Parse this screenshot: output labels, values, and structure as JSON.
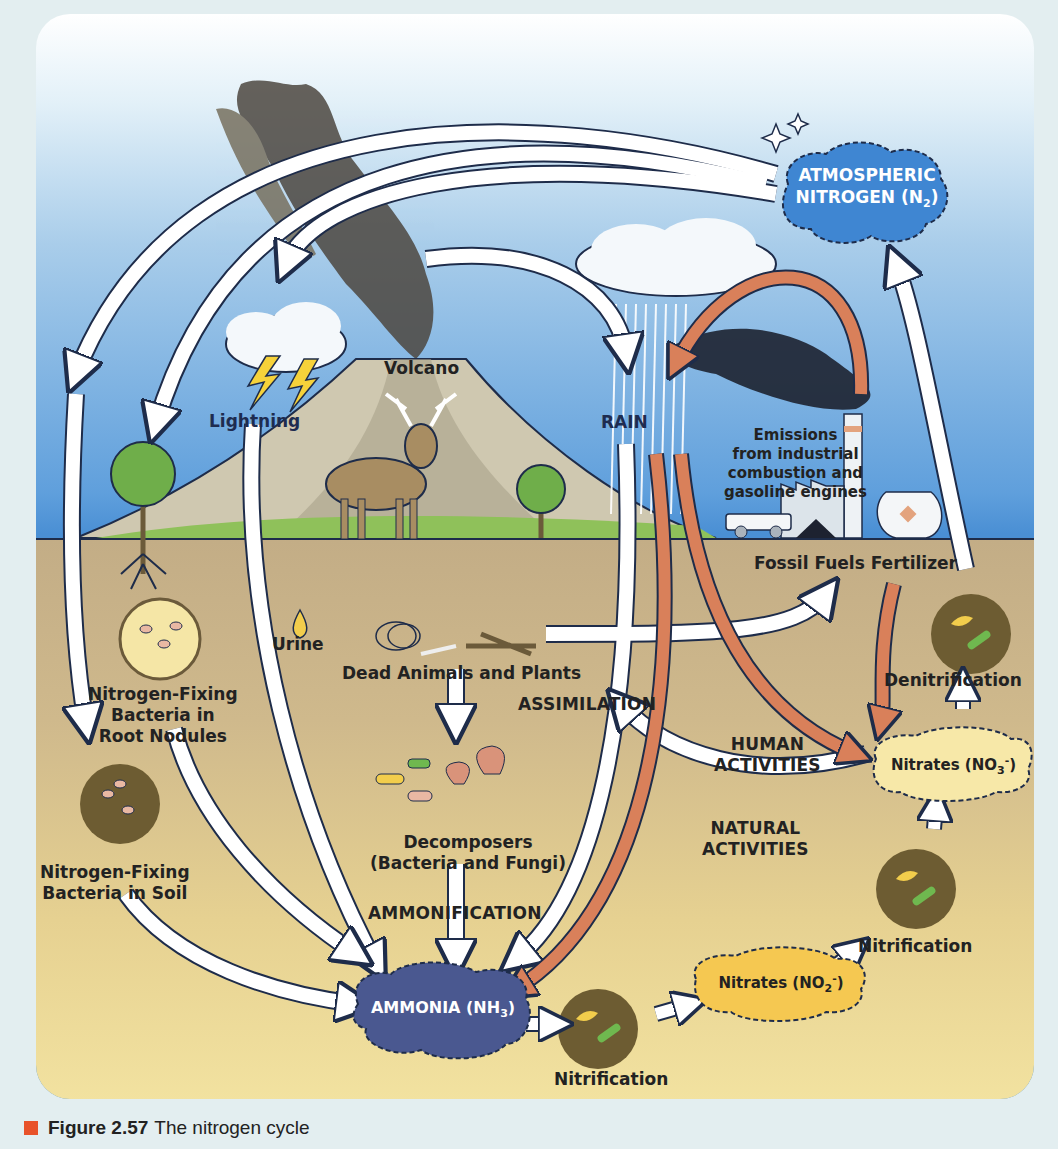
{
  "figure": {
    "caption_number": "Figure 2.57",
    "caption_text": "The nitrogen cycle",
    "colors": {
      "sky_top": "#ffffff",
      "sky_bottom": "#4a8fd4",
      "ground_top": "#c3ad86",
      "ground_bottom": "#f2e2a0",
      "caption_square": "#e8522a",
      "human_arrow": "#d9805a",
      "natural_arrow": "#ffffff",
      "atmospheric_cloud": "#3f86d2",
      "ammonia_cloud": "#4a5890",
      "nitrite_cloud": "#f5c851",
      "nitrate_cloud": "#f7e8a8"
    }
  },
  "nodes": {
    "atmospheric_nitrogen": {
      "line1": "ATMOSPHERIC",
      "line2": "NITROGEN (N",
      "sub": "2",
      "close": ")"
    },
    "ammonia": {
      "text": "AMMONIA (NH",
      "sub": "3",
      "close": ")"
    },
    "nitrites": {
      "text": "Nitrates (NO",
      "sub": "2",
      "sup": "-",
      "close": ")"
    },
    "nitrates": {
      "text": "Nitrates (NO",
      "sub": "3",
      "sup": "-",
      "close": ")"
    }
  },
  "labels": {
    "volcano": "Volcano",
    "lightning": "Lightning",
    "rain": "RAIN",
    "emissions": [
      "Emissions",
      "from industrial",
      "combustion and",
      "gasoline engines"
    ],
    "fossil_fuels": "Fossil Fuels",
    "fertilizer": "Fertilizer",
    "urine": "Urine",
    "dead_animals_plants": "Dead Animals and Plants",
    "assimilation": "ASSIMILATION",
    "nf_root_nodules": [
      "Nitrogen-Fixing",
      "Bacteria in",
      "Root Nodules"
    ],
    "nf_soil": [
      "Nitrogen-Fixing",
      "Bacteria in Soil"
    ],
    "decomposers": [
      "Decomposers",
      "(Bacteria and Fungi)"
    ],
    "ammonification": "AMMONIFICATION",
    "human_activities": [
      "HUMAN",
      "ACTIVITIES"
    ],
    "natural_activities": [
      "NATURAL",
      "ACTIVITIES"
    ],
    "denitrification": "Denitrification",
    "nitrification_bottom": "Nitrification",
    "nitrification_right": "Nitrification"
  }
}
